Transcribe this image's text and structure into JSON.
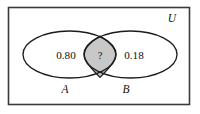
{
  "diagram": {
    "type": "venn-diagram",
    "universe": {
      "label": "U",
      "border_color": "#3a3a3a",
      "fill_color": "#ffffff"
    },
    "sets": [
      {
        "name": "A",
        "label": "A",
        "region_label": "0.80",
        "outline_color": "#1c1c1c"
      },
      {
        "name": "B",
        "label": "B",
        "region_label": "0.18",
        "outline_color": "#1c1c1c"
      }
    ],
    "intersection": {
      "label": "?",
      "fill_color": "#c8c8c8",
      "outline_color": "#1c1c1c",
      "shaded": true
    }
  }
}
